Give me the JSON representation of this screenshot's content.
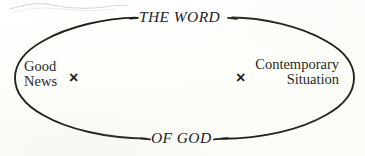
{
  "figure": {
    "type": "ellipse-diagram",
    "title": "",
    "background_color": "#fdfdfb",
    "stroke_color": "#26261f",
    "text_color": "#262622"
  },
  "ellipse": {
    "center_x": 184,
    "center_y": 78,
    "radius_x": 170,
    "radius_y": 62,
    "stroke_width": 1.9,
    "gap_top_label": "THE WORD",
    "gap_bottom_label": "OF GOD"
  },
  "arc_labels": {
    "top": "THE WORD",
    "bottom": "OF GOD"
  },
  "nodes": [
    {
      "id": "good-news",
      "lines": [
        "Good",
        "News"
      ],
      "marker": "×",
      "marker_side": "right",
      "align": "left"
    },
    {
      "id": "contemporary-situation",
      "lines": [
        "Contemporary",
        "Situation"
      ],
      "marker": "×",
      "marker_side": "left",
      "align": "right"
    }
  ],
  "markers": {
    "left_x": "×",
    "right_x": "×"
  },
  "artifacts": {
    "scan_smudge": "faint-gray-wavy-line"
  }
}
